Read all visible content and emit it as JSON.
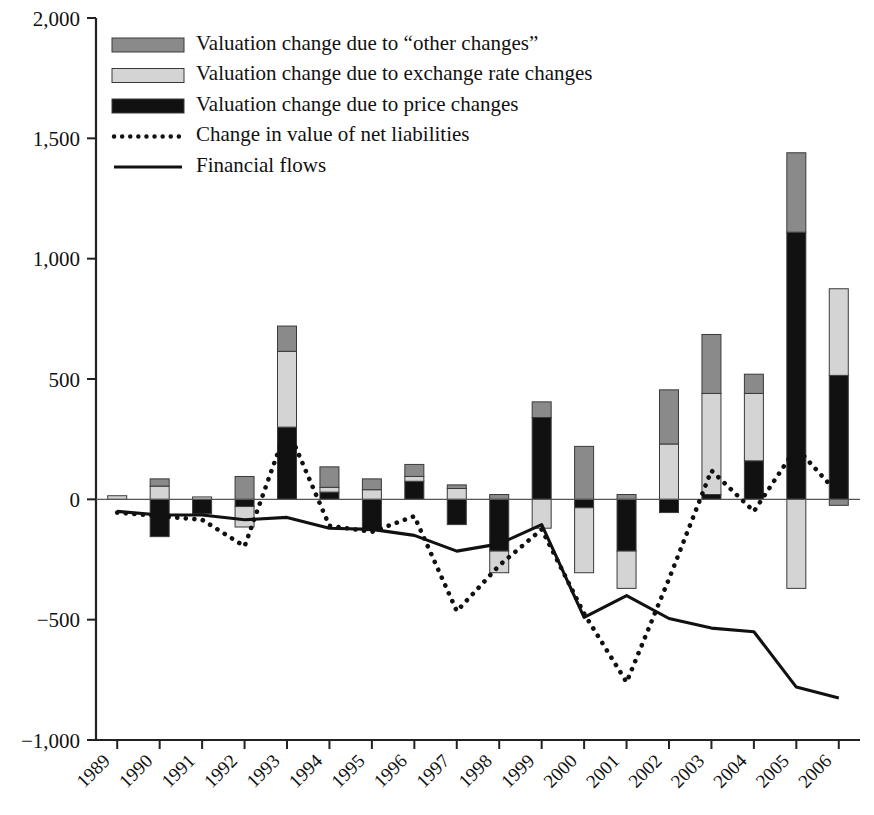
{
  "chart_data": {
    "type": "bar",
    "title": "",
    "subtitle": "",
    "xlabel": "",
    "ylabel": "",
    "grid": false,
    "legend_position": "top-left-inside",
    "categories": [
      "1989",
      "1990",
      "1991",
      "1992",
      "1993",
      "1994",
      "1995",
      "1996",
      "1997",
      "1998",
      "1999",
      "2000",
      "2001",
      "2002",
      "2003",
      "2004",
      "2005",
      "2006"
    ],
    "yticks": [
      -1000,
      -500,
      0,
      500,
      1000,
      1500,
      2000
    ],
    "ytick_labels": [
      "−1,000",
      "−500",
      "0",
      "500",
      "1,000",
      "1,500",
      "2,000"
    ],
    "ylim": [
      -1000,
      2000
    ],
    "stacked": true,
    "series": [
      {
        "name": "Valuation change due to price changes",
        "key": "price",
        "color": "#111111",
        "style": "solid-fill",
        "values": [
          0,
          -155,
          -60,
          -30,
          300,
          30,
          -130,
          75,
          -105,
          -215,
          340,
          -35,
          -215,
          -55,
          20,
          160,
          1110,
          515
        ]
      },
      {
        "name": "Valuation change due to exchange rate changes",
        "key": "fx",
        "color": "#d4d4d4",
        "style": "solid-fill",
        "values": [
          15,
          55,
          10,
          -85,
          315,
          20,
          40,
          20,
          45,
          -90,
          -120,
          -270,
          -155,
          230,
          420,
          280,
          -370,
          360
        ]
      },
      {
        "name": "Valuation change due to “other changes”",
        "key": "other",
        "color": "#8a8a8a",
        "style": "solid-fill",
        "values": [
          0,
          30,
          0,
          95,
          105,
          85,
          45,
          50,
          15,
          20,
          65,
          220,
          20,
          225,
          245,
          80,
          330,
          -25
        ]
      }
    ],
    "lines": [
      {
        "name": "Change in value of net liabilities",
        "key": "net_liabilities",
        "color": "#111111",
        "style": "dotted",
        "values": [
          -55,
          -70,
          -85,
          -195,
          300,
          -110,
          -135,
          -70,
          -465,
          -275,
          -125,
          -475,
          -760,
          -330,
          120,
          -50,
          215,
          20
        ]
      },
      {
        "name": "Financial flows",
        "key": "financial_flows",
        "color": "#111111",
        "style": "solid",
        "values": [
          -50,
          -65,
          -65,
          -85,
          -75,
          -120,
          -125,
          -150,
          -215,
          -185,
          -105,
          -490,
          -400,
          -495,
          -535,
          -550,
          -780,
          -825
        ]
      }
    ],
    "legend": [
      {
        "label": "Valuation change due to “other changes”",
        "swatch": "other",
        "marker": "patch"
      },
      {
        "label": "Valuation change due to exchange rate changes",
        "swatch": "fx",
        "marker": "patch"
      },
      {
        "label": "Valuation change due to price changes",
        "swatch": "price",
        "marker": "patch"
      },
      {
        "label": "Change in value of net liabilities",
        "swatch": "net_liabilities",
        "marker": "dotted-line"
      },
      {
        "label": "Financial flows",
        "swatch": "financial_flows",
        "marker": "solid-line"
      }
    ]
  },
  "colors": {
    "other": "#8a8a8a",
    "fx": "#d4d4d4",
    "price": "#111111",
    "axis": "#222222",
    "background": "#ffffff"
  }
}
